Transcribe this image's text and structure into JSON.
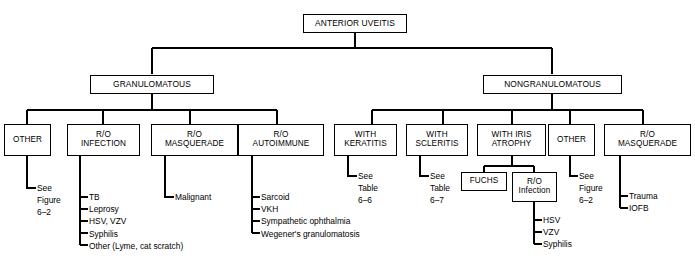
{
  "figure": {
    "type": "flowchart",
    "title": "ANTERIOR UVEITIS",
    "orientation": "top-down",
    "line_color": "#000000",
    "background_color": "#ffffff"
  },
  "nodes": {
    "root": {
      "label": "ANTERIOR UVEITIS"
    },
    "granulomatous": {
      "label": "GRANULOMATOUS"
    },
    "nongranulomatous": {
      "label": "NONGRANULOMATOUS"
    },
    "g_other": {
      "label": "OTHER"
    },
    "g_infection": {
      "label": "R/O\nINFECTION"
    },
    "g_masquerade": {
      "label": "R/O\nMASQUERADE"
    },
    "g_autoimmune": {
      "label": "R/O\nAUTOIMMUNE"
    },
    "n_keratitis": {
      "label": "WITH\nKERATITIS"
    },
    "n_scleritis": {
      "label": "WITH\nSCLERITIS"
    },
    "n_iris_atrophy": {
      "label": "WITH IRIS\nATROPHY"
    },
    "n_other": {
      "label": "OTHER"
    },
    "n_masquerade": {
      "label": "R/O\nMASQUERADE"
    },
    "fuchs": {
      "label": "FUCHS"
    },
    "n_infection": {
      "label": "R/O\nInfection"
    }
  },
  "leaves": {
    "g_other_ref": {
      "text": "See\nFigure\n6–2"
    },
    "g_infection_items": [
      "TB",
      "Leprosy",
      "HSV, VZV",
      "Syphilis",
      "Other (Lyme, cat scratch)"
    ],
    "g_masquerade_items": [
      "Malignant"
    ],
    "g_autoimmune_items": [
      "Sarcoid",
      "VKH",
      "Sympathetic ophthalmia",
      "Wegener's granulomatosis"
    ],
    "n_keratitis_ref": {
      "text": "See\nTable\n6–6"
    },
    "n_scleritis_ref": {
      "text": "See\nTable\n6–7"
    },
    "n_infection_items": [
      "HSV",
      "VZV",
      "Syphilis"
    ],
    "n_other_ref": {
      "text": "See\nFigure\n6–2"
    },
    "n_masquerade_items": [
      "Trauma",
      "IOFB"
    ]
  }
}
